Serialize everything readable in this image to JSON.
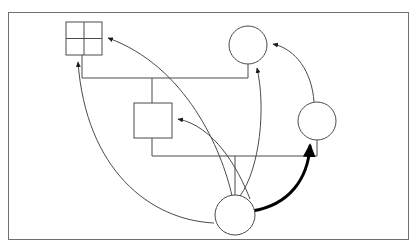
{
  "figure": {
    "title": "",
    "type": "node-link-diagram",
    "background_color": "#ffffff",
    "stroke_color": "#3b3b3b",
    "bold_stroke_color": "#000000",
    "thin_stroke_width": 1,
    "bold_stroke_width": 3,
    "canvas": {
      "width": 419,
      "height": 251
    }
  },
  "frame": {
    "name": "outer-border",
    "x": 8,
    "y": 12,
    "width": 401,
    "height": 228,
    "stroke": "#707070",
    "fill": "none"
  },
  "nodes": [
    {
      "id": "grid-square",
      "label": "",
      "shape": "square-quadrants",
      "x": 66,
      "y": 22,
      "width": 36,
      "height": 33,
      "divisions": 2,
      "fill": "#ffffff",
      "stroke": "#3b3b3b"
    },
    {
      "id": "plain-rect",
      "label": "",
      "shape": "rectangle",
      "x": 134,
      "y": 103,
      "width": 38,
      "height": 35,
      "fill": "#ffffff",
      "stroke": "#3b3b3b"
    },
    {
      "id": "top-circle",
      "label": "",
      "shape": "circle",
      "cx": 248,
      "cy": 45,
      "r": 19,
      "fill": "#ffffff",
      "stroke": "#3b3b3b"
    },
    {
      "id": "right-circle",
      "label": "",
      "shape": "circle",
      "cx": 317,
      "cy": 121,
      "r": 19,
      "fill": "#ffffff",
      "stroke": "#3b3b3b"
    },
    {
      "id": "bottom-circle",
      "label": "",
      "shape": "circle",
      "cx": 235,
      "cy": 215,
      "r": 20,
      "fill": "#ffffff",
      "stroke": "#3b3b3b"
    }
  ],
  "edges": [
    {
      "id": "edge-orthogonal-upper",
      "from": "grid-square",
      "to": "top-circle",
      "style": "orthogonal",
      "weight": "thin",
      "arrow": false,
      "path": "M 82 55 L 82 78 L 248 78 L 248 64"
    },
    {
      "id": "edge-orthogonal-upper-branch",
      "from": "edge-orthogonal-upper",
      "to": "plain-rect",
      "style": "orthogonal-branch",
      "weight": "thin",
      "arrow": false,
      "path": "M 152 78 L 152 103"
    },
    {
      "id": "edge-orthogonal-lower",
      "from": "plain-rect",
      "to": "right-circle",
      "style": "orthogonal",
      "weight": "thin",
      "arrow": false,
      "path": "M 152 138 L 152 156 L 317 156 L 317 140"
    },
    {
      "id": "edge-orthogonal-lower-branch",
      "from": "edge-orthogonal-lower",
      "to": "bottom-circle",
      "style": "orthogonal-branch",
      "weight": "thin",
      "arrow": false,
      "path": "M 235 156 L 235 195"
    },
    {
      "id": "edge-bottom-to-square-left",
      "from": "bottom-circle",
      "to": "grid-square",
      "style": "curve",
      "weight": "thin",
      "arrow": true,
      "arrow_at": "grid-square-bottom",
      "path": "M 216 221 C 150 215 88 160 79 61"
    },
    {
      "id": "edge-bottom-to-square-right",
      "from": "bottom-circle",
      "to": "grid-square",
      "style": "curve",
      "weight": "thin",
      "arrow": true,
      "arrow_at": "grid-square-right",
      "path": "M 232 195 C 215 150 180 70 107 39"
    },
    {
      "id": "edge-bottom-to-rect",
      "from": "bottom-circle",
      "to": "plain-rect",
      "style": "curve",
      "weight": "thin",
      "arrow": true,
      "arrow_at": "plain-rect-right",
      "path": "M 248 198 C 235 165 215 125 177 119"
    },
    {
      "id": "edge-bottom-to-top-circle",
      "from": "bottom-circle",
      "to": "top-circle",
      "style": "curve",
      "weight": "thin",
      "arrow": true,
      "arrow_at": "top-circle-bottom",
      "path": "M 239 195 C 258 170 265 110 257 69"
    },
    {
      "id": "edge-right-to-top-circle",
      "from": "right-circle",
      "to": "top-circle",
      "style": "curve",
      "weight": "thin",
      "arrow": true,
      "arrow_at": "top-circle-right",
      "path": "M 314 102 C 310 70 295 48 272 44"
    },
    {
      "id": "edge-bottom-to-right-circle-bold",
      "from": "bottom-circle",
      "to": "right-circle",
      "style": "curve",
      "weight": "bold",
      "arrow": true,
      "arrow_at": "right-circle-bottom",
      "path": "M 254 210 C 288 203 308 175 310 145"
    }
  ]
}
